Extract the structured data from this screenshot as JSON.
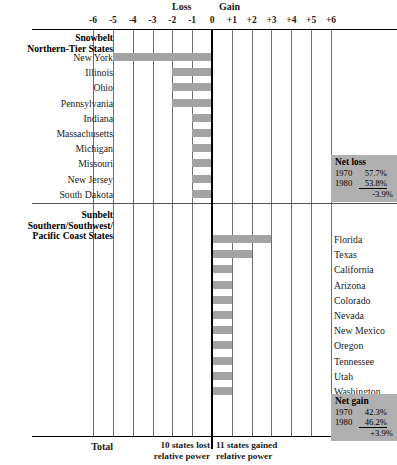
{
  "axis": {
    "loss_label": "Loss",
    "gain_label": "Gain",
    "ticks": [
      "-6",
      "-5",
      "-4",
      "-3",
      "-2",
      "-1",
      "0",
      "+1",
      "+2",
      "+3",
      "+4",
      "+5",
      "+6"
    ]
  },
  "sections": {
    "snowbelt": {
      "title": "Snowbelt",
      "subtitle": "Northern-Tier States"
    },
    "sunbelt": {
      "title": "Sunbelt",
      "subtitle_line1": "Southern/Southwest/",
      "subtitle_line2": "Pacific Coast States"
    }
  },
  "net_loss_box": {
    "title": "Net loss",
    "year1": "1970",
    "value1": "57.7%",
    "year2": "1980",
    "value2": "53.8%",
    "delta": "-3.9%"
  },
  "net_gain_box": {
    "title": "Net gain",
    "year1": "1970",
    "value1": "42.3%",
    "year2": "1980",
    "value2": "46.2%",
    "delta": "+3.9%"
  },
  "footer": {
    "total_label": "Total",
    "loss_note_line1": "10 states lost",
    "loss_note_line2": "relative power",
    "gain_note_line1": "11 states gained",
    "gain_note_line2": "relative power"
  },
  "colors": {
    "bar": "#a3a3a3",
    "box": "#b0b0b0",
    "axis": "#000000",
    "grid": "#6e6e6e"
  },
  "chart_data": {
    "type": "bar",
    "orientation": "horizontal",
    "title": "",
    "xlabel": "",
    "ylabel": "",
    "xlim": [
      -6,
      6
    ],
    "grid": true,
    "xticks": [
      -6,
      -5,
      -4,
      -3,
      -2,
      -1,
      0,
      1,
      2,
      3,
      4,
      5,
      6
    ],
    "xticklabels": [
      "-6",
      "-5",
      "-4",
      "-3",
      "-2",
      "-1",
      "0",
      "+1",
      "+2",
      "+3",
      "+4",
      "+5",
      "+6"
    ],
    "annotations": [
      "Loss",
      "Gain",
      "10 states lost relative power",
      "11 states gained relative power"
    ],
    "groups": [
      {
        "name": "Snowbelt",
        "subtitle": "Northern-Tier States",
        "label_side": "left",
        "categories": [
          "New York",
          "Illinois",
          "Ohio",
          "Pennsylvania",
          "Indiana",
          "Massachusetts",
          "Michigan",
          "Missouri",
          "New Jersey",
          "South Dakota"
        ],
        "values": [
          -5,
          -2,
          -2,
          -2,
          -1,
          -1,
          -1,
          -1,
          -1,
          -1
        ],
        "summary": {
          "title": "Net loss",
          "1970": 57.7,
          "1980": 53.8,
          "change": -3.9,
          "unit": "%"
        }
      },
      {
        "name": "Sunbelt",
        "subtitle": "Southern/Southwest/Pacific Coast States",
        "label_side": "right",
        "categories": [
          "Florida",
          "Texas",
          "California",
          "Arizona",
          "Colorado",
          "Nevada",
          "New Mexico",
          "Oregon",
          "Tennessee",
          "Utah",
          "Washington"
        ],
        "values": [
          3,
          2,
          1,
          1,
          1,
          1,
          1,
          1,
          1,
          1,
          1
        ],
        "summary": {
          "title": "Net gain",
          "1970": 42.3,
          "1980": 46.2,
          "change": 3.9,
          "unit": "%"
        }
      }
    ]
  }
}
